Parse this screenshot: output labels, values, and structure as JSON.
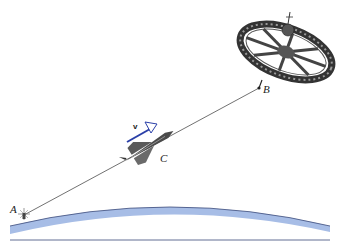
{
  "labels": {
    "point_a": "A",
    "point_b": "B",
    "point_c": "C",
    "velocity": "v"
  },
  "colors": {
    "earth_surface": "#a7bde6",
    "earth_edge": "#3b4a7a",
    "velocity_arrow": "#2a3fa8",
    "line": "#333333"
  }
}
